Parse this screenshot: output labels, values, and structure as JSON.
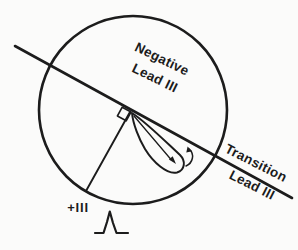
{
  "diagram": {
    "labels": {
      "negative_region_line1": "Negative",
      "negative_region_line2": "Lead III",
      "transition_line1": "Transition",
      "transition_line2": "Lead III",
      "positive_pole": "+III"
    },
    "colors": {
      "ink": "#1c1c1c",
      "background": "#fbfbfa"
    }
  }
}
